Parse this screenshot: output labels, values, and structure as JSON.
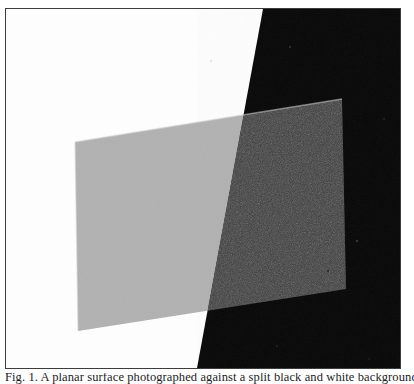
{
  "page": {
    "background_color": "#ffffff",
    "width": 414,
    "height": 384
  },
  "figure": {
    "name": "translucent-plane-over-split-background",
    "frame": {
      "border_color": "#3c3c3c",
      "border_width_px": 1,
      "x": 5,
      "y": 8,
      "width": 396,
      "height": 361
    },
    "background": {
      "description": "Background split by a near-vertical diagonal edge: white on the left, black on the right",
      "left_region": {
        "name": "white-background-region",
        "color": "#fdfdfd"
      },
      "right_region": {
        "name": "black-background-region",
        "color": "#080808"
      },
      "diagonal_edge": {
        "name": "white-black-diagonal-edge",
        "top_point": [
          262,
          8
        ],
        "bottom_point": [
          196,
          369
        ]
      }
    },
    "overlay": {
      "name": "translucent-gray-quadrilateral",
      "description": "A semi-transparent quadrilateral panel, lighter where it covers the white background and darker where it covers the black background",
      "corners": {
        "top_left": [
          74,
          141
        ],
        "top_right": [
          341,
          98
        ],
        "bottom_right": [
          345,
          288
        ],
        "bottom_left": [
          77,
          330
        ]
      },
      "color_over_white": "#b1b1b1",
      "color_over_black": "#3b3b3b",
      "edge_highlight_color": "#c9c9c9",
      "texture": "fine film grain / halftone noise"
    },
    "speckles": [
      {
        "x": 289,
        "y": 46,
        "r": 1.2,
        "color": "#2c2c2c"
      },
      {
        "x": 383,
        "y": 118,
        "r": 1.0,
        "color": "#242424"
      },
      {
        "x": 356,
        "y": 240,
        "r": 1.3,
        "color": "#303030"
      },
      {
        "x": 327,
        "y": 270,
        "r": 1.0,
        "color": "#262626"
      },
      {
        "x": 276,
        "y": 345,
        "r": 1.1,
        "color": "#232323"
      },
      {
        "x": 368,
        "y": 358,
        "r": 0.9,
        "color": "#1f1f1f"
      },
      {
        "x": 210,
        "y": 60,
        "r": 0.9,
        "color": "#dcdcdc"
      }
    ]
  },
  "caption": {
    "name": "figure-caption",
    "text": "Fig. 1. A planar surface photographed against a split black and white background.",
    "clipped": true,
    "note": "Only the uppermost few pixels of this caption line are visible at the bottom edge of the screenshot."
  }
}
